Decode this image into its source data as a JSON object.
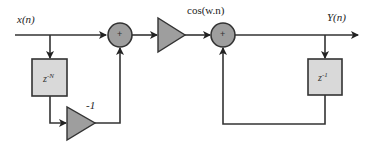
{
  "diagram": {
    "title": "",
    "nodes": {
      "input": {
        "label": "x(n)"
      },
      "delay_n": {
        "label_base": "z",
        "label_exp": "-N",
        "type": "delay-block"
      },
      "gain_neg": {
        "label": "-1",
        "type": "gain-triangle"
      },
      "summer_1": {
        "symbol": "+",
        "type": "adder"
      },
      "gain_mid": {
        "label": "",
        "type": "gain-triangle"
      },
      "summer_2": {
        "symbol": "+",
        "type": "adder"
      },
      "cos_input": {
        "label": "cos(w.n)"
      },
      "delay_1": {
        "label_base": "z",
        "label_exp": "-1",
        "type": "delay-block"
      },
      "output": {
        "label": "Y(n)"
      }
    },
    "edges": [
      {
        "from": "input",
        "to": "summer_1"
      },
      {
        "from": "input",
        "to": "delay_n"
      },
      {
        "from": "delay_n",
        "to": "gain_neg"
      },
      {
        "from": "gain_neg",
        "to": "summer_1"
      },
      {
        "from": "summer_1",
        "to": "gain_mid"
      },
      {
        "from": "gain_mid",
        "to": "summer_2"
      },
      {
        "from": "summer_2",
        "to": "output"
      },
      {
        "from": "output",
        "to": "delay_1"
      },
      {
        "from": "delay_1",
        "to": "summer_2"
      }
    ],
    "colors": {
      "line": "#333333",
      "block_fill": "#d9d9d9",
      "adder_fill": "#9e9e9e",
      "gain_fill": "#9e9e9e"
    }
  }
}
